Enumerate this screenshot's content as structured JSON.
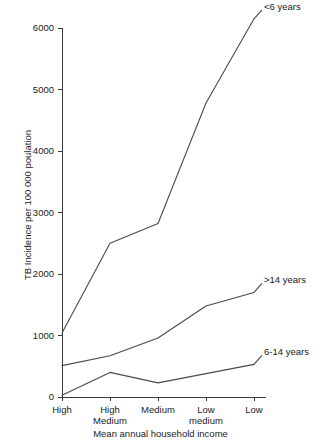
{
  "chart_data": {
    "type": "line",
    "title": "",
    "xlabel": "Mean annual household income",
    "ylabel": "TB Incidence per 100 000 poulation",
    "categories": [
      "High",
      "High Medium",
      "Medium",
      "Low medium",
      "Low"
    ],
    "category_lines": [
      [
        "High"
      ],
      [
        "High",
        "Medium"
      ],
      [
        "Medium"
      ],
      [
        "Low",
        "medium"
      ],
      [
        "Low"
      ]
    ],
    "ylim": [
      0,
      6000
    ],
    "yticks": [
      0,
      1000,
      2000,
      3000,
      4000,
      5000,
      6000
    ],
    "ytick_labels": [
      "0",
      "1000",
      "2000",
      "3000",
      "4000",
      "5000",
      "6000"
    ],
    "grid": false,
    "legend_position": "inline-annotations",
    "series": [
      {
        "name": "<6 years",
        "values": [
          1040,
          2500,
          2820,
          4780,
          6150
        ]
      },
      {
        "name": ">14 years",
        "values": [
          510,
          670,
          960,
          1480,
          1700
        ]
      },
      {
        "name": "6-14 years",
        "values": [
          30,
          400,
          230,
          380,
          530
        ]
      }
    ],
    "annotations": [
      {
        "text": "<6 years",
        "series": "<6 years"
      },
      {
        "text": ">14 years",
        "series": ">14 years"
      },
      {
        "text": "6-14 years",
        "series": "6-14 years"
      }
    ],
    "colors": {
      "line": "#4a4a4a",
      "axis": "#3a3a3a",
      "text": "#1a1a1a",
      "background": "#ffffff"
    }
  }
}
